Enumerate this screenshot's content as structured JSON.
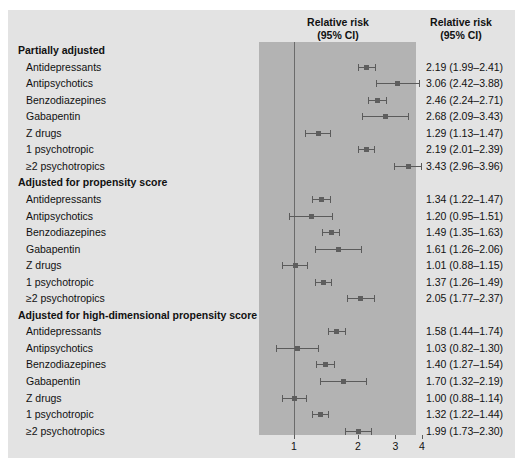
{
  "figure": {
    "background_color": "#e3e3e3",
    "band_color": "#b3b3b3",
    "marker_color": "#5e5e5e"
  },
  "headers": {
    "plot_title_line1": "Relative risk",
    "plot_title_line2": "(95% CI)",
    "value_title_line1": "Relative risk",
    "value_title_line2": "(95% CI)"
  },
  "chart_data": {
    "type": "scatter",
    "title": "Relative risk (95% CI)",
    "xlabel": "",
    "ylabel": "",
    "scale": "log",
    "xlim": [
      0.78,
      4.4
    ],
    "xticks": [
      1,
      2,
      3,
      4
    ],
    "xtick_labels": [
      "1",
      "2",
      "3",
      "4"
    ],
    "reference_line": 1,
    "grid": false,
    "legend": "none",
    "groups": [
      {
        "name": "Partially adjusted",
        "rows": [
          {
            "label": "Antidepressants",
            "estimate": 2.19,
            "low": 1.99,
            "high": 2.41,
            "text": "2.19 (1.99–2.41)"
          },
          {
            "label": "Antipsychotics",
            "estimate": 3.06,
            "low": 2.42,
            "high": 3.88,
            "text": "3.06 (2.42–3.88)"
          },
          {
            "label": "Benzodiazepines",
            "estimate": 2.46,
            "low": 2.24,
            "high": 2.71,
            "text": "2.46 (2.24–2.71)"
          },
          {
            "label": "Gabapentin",
            "estimate": 2.68,
            "low": 2.09,
            "high": 3.43,
            "text": "2.68 (2.09–3.43)"
          },
          {
            "label": "Z drugs",
            "estimate": 1.29,
            "low": 1.13,
            "high": 1.47,
            "text": "1.29 (1.13–1.47)"
          },
          {
            "label": "1 psychotropic",
            "estimate": 2.19,
            "low": 2.01,
            "high": 2.39,
            "text": "2.19 (2.01–2.39)"
          },
          {
            "label": "≥2 psychotropics",
            "estimate": 3.43,
            "low": 2.96,
            "high": 3.96,
            "text": "3.43 (2.96–3.96)"
          }
        ]
      },
      {
        "name": "Adjusted for propensity score",
        "rows": [
          {
            "label": "Antidepressants",
            "estimate": 1.34,
            "low": 1.22,
            "high": 1.47,
            "text": "1.34 (1.22–1.47)"
          },
          {
            "label": "Antipsychotics",
            "estimate": 1.2,
            "low": 0.95,
            "high": 1.51,
            "text": "1.20 (0.95–1.51)"
          },
          {
            "label": "Benzodiazepines",
            "estimate": 1.49,
            "low": 1.35,
            "high": 1.63,
            "text": "1.49 (1.35–1.63)"
          },
          {
            "label": "Gabapentin",
            "estimate": 1.61,
            "low": 1.26,
            "high": 2.06,
            "text": "1.61 (1.26–2.06)"
          },
          {
            "label": "Z drugs",
            "estimate": 1.01,
            "low": 0.88,
            "high": 1.15,
            "text": "1.01 (0.88–1.15)"
          },
          {
            "label": "1 psychotropic",
            "estimate": 1.37,
            "low": 1.26,
            "high": 1.49,
            "text": "1.37 (1.26–1.49)"
          },
          {
            "label": "≥2 psychotropics",
            "estimate": 2.05,
            "low": 1.77,
            "high": 2.37,
            "text": "2.05 (1.77–2.37)"
          }
        ]
      },
      {
        "name": "Adjusted for high-dimensional propensity score",
        "rows": [
          {
            "label": "Antidepressants",
            "estimate": 1.58,
            "low": 1.44,
            "high": 1.74,
            "text": "1.58 (1.44–1.74)"
          },
          {
            "label": "Antipsychotics",
            "estimate": 1.03,
            "low": 0.82,
            "high": 1.3,
            "text": "1.03 (0.82–1.30)"
          },
          {
            "label": "Benzodiazepines",
            "estimate": 1.4,
            "low": 1.27,
            "high": 1.54,
            "text": "1.40 (1.27–1.54)"
          },
          {
            "label": "Gabapentin",
            "estimate": 1.7,
            "low": 1.32,
            "high": 2.19,
            "text": "1.70 (1.32–2.19)"
          },
          {
            "label": "Z drugs",
            "estimate": 1.0,
            "low": 0.88,
            "high": 1.14,
            "text": "1.00 (0.88–1.14)"
          },
          {
            "label": "1 psychotropic",
            "estimate": 1.32,
            "low": 1.22,
            "high": 1.44,
            "text": "1.32 (1.22–1.44)"
          },
          {
            "label": "≥2 psychotropics",
            "estimate": 1.99,
            "low": 1.73,
            "high": 2.3,
            "text": "1.99 (1.73–2.30)"
          }
        ]
      }
    ]
  }
}
